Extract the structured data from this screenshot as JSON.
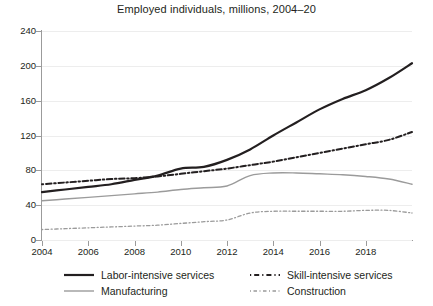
{
  "chart_data": {
    "type": "line",
    "title": "Employed individuals, millions, 2004–20",
    "xlabel": "",
    "ylabel": "",
    "xlim": [
      2004,
      2020
    ],
    "ylim": [
      0,
      240
    ],
    "yticks": [
      0,
      40,
      80,
      120,
      160,
      200,
      240
    ],
    "xticks": [
      2004,
      2006,
      2008,
      2010,
      2012,
      2014,
      2016,
      2018
    ],
    "x": [
      2004,
      2005,
      2006,
      2007,
      2008,
      2009,
      2010,
      2011,
      2012,
      2013,
      2014,
      2015,
      2016,
      2017,
      2018,
      2019,
      2020
    ],
    "grid": "horizontal",
    "legend_position": "bottom",
    "series": [
      {
        "name": "Labor-intensive services",
        "style": "solid",
        "color": "#231f20",
        "width": 2.2,
        "values": [
          55,
          58,
          61,
          64,
          69,
          74,
          82,
          84,
          92,
          104,
          120,
          135,
          150,
          162,
          172,
          186,
          203
        ]
      },
      {
        "name": "Skill-intensive services",
        "style": "dashed",
        "color": "#231f20",
        "width": 2.0,
        "values": [
          64,
          66,
          68,
          70,
          71,
          73,
          76,
          79,
          82,
          86,
          90,
          95,
          100,
          105,
          110,
          115,
          124
        ]
      },
      {
        "name": "Manufacturing",
        "style": "solid",
        "color": "#9b9b9b",
        "width": 1.4,
        "values": [
          45,
          47,
          49,
          51,
          53,
          55,
          58,
          60,
          62,
          74,
          77,
          77,
          76,
          75,
          73,
          70,
          64
        ]
      },
      {
        "name": "Construction",
        "style": "dashed-fine",
        "color": "#9b9b9b",
        "width": 1.3,
        "values": [
          12,
          13,
          14,
          15,
          16,
          17,
          19,
          21,
          23,
          31,
          33,
          33,
          33,
          33,
          34,
          34,
          31
        ]
      }
    ]
  },
  "legend": [
    {
      "label": "Labor-intensive services"
    },
    {
      "label": "Skill-intensive services"
    },
    {
      "label": "Manufacturing"
    },
    {
      "label": "Construction"
    }
  ]
}
